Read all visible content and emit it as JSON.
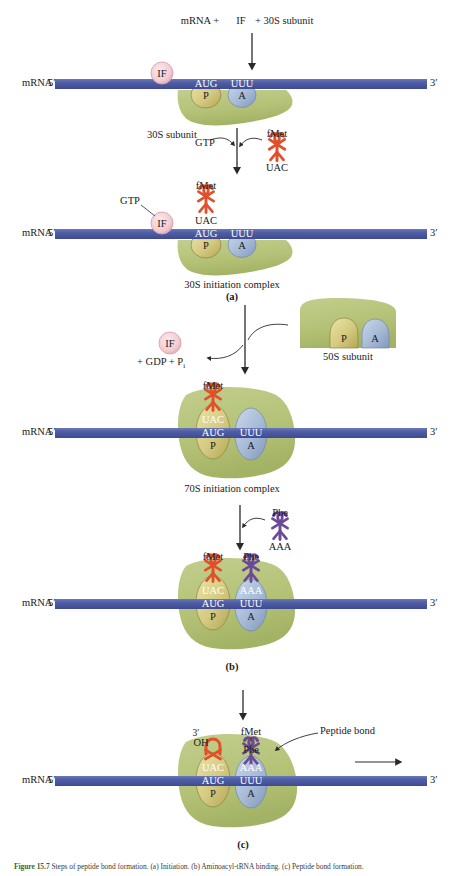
{
  "figure": {
    "caption_prefix": "Figure 15.7",
    "caption_text": "Steps of peptide bond formation. (a) Initiation. (b) Aminoacyl-tRNA binding. (c) Peptide bond formation."
  },
  "colors": {
    "mrna_band": "#4a5aa0",
    "mrna_band_light": "#6472b4",
    "ribosome_green": "#b6c47a",
    "ribosome_green_dark": "#9cae60",
    "p_site": "#d8d08a",
    "p_site_dark": "#b0a551",
    "a_site": "#a8bcd8",
    "a_site_dark": "#7d94b8",
    "if_circle": "#f2cdd4",
    "if_border": "#d9949f",
    "trna_fmet": "#e0502a",
    "trna_phe": "#6b4a96",
    "arrow": "#2a2a2a",
    "text": "#1a1a1a"
  },
  "labels": {
    "mrna": "mRNA",
    "five_prime": "5′",
    "three_prime": "3′",
    "codon_p": "AUG",
    "codon_a": "UUU",
    "site_p": "P",
    "site_a": "A",
    "anticodon_fmet": "UAC",
    "anticodon_phe": "AAA",
    "aa_fmet": "fMet",
    "aa_phe": "Phe",
    "if": "IF",
    "gtp": "GTP",
    "three_prime_oh_prime": "3′",
    "oh": "OH",
    "peptide_bond": "Peptide bond"
  },
  "steps": {
    "header": {
      "part1": "mRNA +",
      "factor": "IF",
      "part2": "+ 30S subunit"
    },
    "subunit_30s": "30S subunit",
    "complex_30s": "30S initiation complex",
    "panel_a": "(a)",
    "release": {
      "factor": "IF",
      "products": "+ GDP + P",
      "subscript": "i"
    },
    "subunit_50s": "50S subunit",
    "complex_70s": "70S initiation complex",
    "panel_b": "(b)",
    "panel_c": "(c)"
  },
  "trnas": {
    "fmet": {
      "amino_acid": "fMet",
      "anticodon": "UAC",
      "color": "#e0502a"
    },
    "phe": {
      "amino_acid": "Phe",
      "anticodon": "AAA",
      "color": "#6b4a96"
    }
  }
}
